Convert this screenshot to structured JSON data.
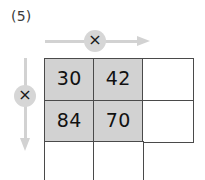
{
  "problem": {
    "label": "(5)"
  },
  "colors": {
    "shaded_cell": "#d2d2d2",
    "arrow": "#d2d2d2",
    "badge": "#d6d6d6",
    "grid_line": "#4a4a4a",
    "text": "#111111",
    "background": "#ffffff"
  },
  "operators": {
    "horizontal": {
      "symbol": "×",
      "icon": "multiply-icon",
      "direction": "right",
      "arrow_icon": "arrow-right-icon"
    },
    "vertical": {
      "symbol": "×",
      "icon": "multiply-icon",
      "direction": "down",
      "arrow_icon": "arrow-down-icon"
    }
  },
  "grid": {
    "rows": 3,
    "columns": 3,
    "cells": [
      [
        {
          "value": "30",
          "shaded": true,
          "visible": true
        },
        {
          "value": "42",
          "shaded": true,
          "visible": true
        },
        {
          "value": "",
          "shaded": false,
          "visible": true
        }
      ],
      [
        {
          "value": "84",
          "shaded": true,
          "visible": true
        },
        {
          "value": "70",
          "shaded": true,
          "visible": true
        },
        {
          "value": "",
          "shaded": false,
          "visible": true
        }
      ],
      [
        {
          "value": "",
          "shaded": false,
          "visible": true
        },
        {
          "value": "",
          "shaded": false,
          "visible": true
        },
        {
          "value": "",
          "shaded": false,
          "visible": false
        }
      ]
    ],
    "geometry": {
      "col_edges": [
        0,
        49,
        98,
        148
      ],
      "row_edges": [
        0,
        42,
        83,
        122
      ]
    }
  }
}
